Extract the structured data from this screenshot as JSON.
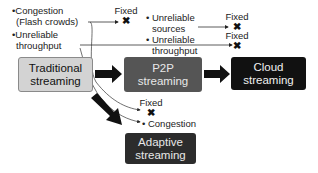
{
  "nodes": {
    "traditional": {
      "line1": "Traditional",
      "line2": "streaming",
      "fill": "#d3d3d3"
    },
    "p2p": {
      "line1": "P2P",
      "line2": "streaming",
      "fill": "#555555"
    },
    "cloud": {
      "line1": "Cloud",
      "line2": "streaming",
      "fill": "#111111"
    },
    "adaptive": {
      "line1": "Adaptive",
      "line2": "streaming",
      "fill": "#2c2c2c"
    }
  },
  "traditional_issues": [
    {
      "bullet": "•",
      "line1": "Congestion",
      "line2": "(Flash crowds)"
    },
    {
      "bullet": "•",
      "line1": "Unreliable",
      "line2": "throughput"
    }
  ],
  "p2p_issues": [
    {
      "bullet": "•",
      "line1": "Unreliable",
      "line2": "sources"
    },
    {
      "bullet": "•",
      "line1": "Unreliable",
      "line2": "throughput"
    }
  ],
  "adaptive_issue": {
    "bullet": "•",
    "label": "Congestion"
  },
  "fixed_label": "Fixed",
  "fixed_mark": "✖",
  "annotations": {
    "fixed_top": "Fixed",
    "fixed_sources": "Fixed",
    "fixed_throughput": "Fixed",
    "fixed_adaptive": "Fixed"
  }
}
